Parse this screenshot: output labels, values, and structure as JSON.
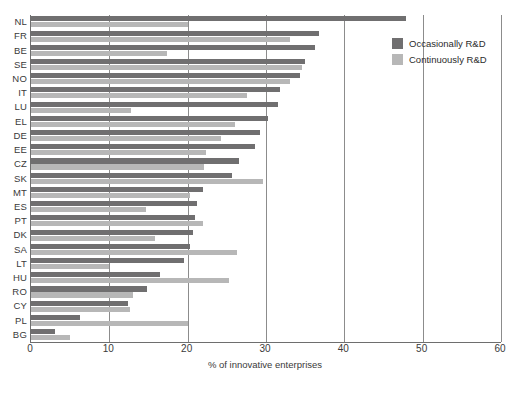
{
  "chart_data": {
    "type": "bar",
    "orientation": "horizontal",
    "title": "",
    "xlabel": "% of innovative enterprises",
    "ylabel": "",
    "xlim": [
      0,
      60
    ],
    "xticks": [
      0,
      10,
      20,
      30,
      40,
      50,
      60
    ],
    "grid": "vertical",
    "legend_position": "top-right",
    "categories": [
      "NL",
      "FR",
      "BE",
      "SE",
      "NO",
      "IT",
      "LU",
      "EL",
      "DE",
      "EE",
      "CZ",
      "SK",
      "MT",
      "ES",
      "PT",
      "DK",
      "SA",
      "LT",
      "HU",
      "RO",
      "CY",
      "PL",
      "BG"
    ],
    "series": [
      {
        "name": "Occasionally R&D",
        "color": "#706f70",
        "values": [
          47.9,
          36.8,
          36.3,
          35.0,
          34.3,
          31.8,
          31.5,
          30.2,
          29.2,
          28.6,
          26.6,
          25.7,
          21.9,
          21.2,
          20.9,
          20.7,
          20.3,
          19.5,
          16.5,
          14.8,
          12.4,
          6.3,
          3.1
        ]
      },
      {
        "name": "Continuously R&D",
        "color": "#b7b7b7",
        "values": [
          20.0,
          33.0,
          17.4,
          34.6,
          33.1,
          27.6,
          12.8,
          26.1,
          24.3,
          22.4,
          22.1,
          29.6,
          20.3,
          14.7,
          22.0,
          15.8,
          26.3,
          10.0,
          25.3,
          13.0,
          12.7,
          20.0,
          5.0
        ]
      }
    ]
  },
  "legend": {
    "items": [
      {
        "label": "Occasionally R&D",
        "color": "#706f70"
      },
      {
        "label": "Continuously R&D",
        "color": "#b7b7b7"
      }
    ]
  },
  "axis": {
    "x_title": "% of innovative enterprises",
    "tick_labels": [
      "0",
      "10",
      "20",
      "30",
      "40",
      "50",
      "60"
    ]
  }
}
